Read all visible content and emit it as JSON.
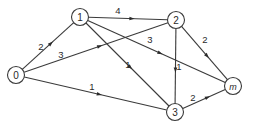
{
  "diagram": {
    "type": "directed-weighted-network",
    "nodes": [
      {
        "id": "0",
        "label": "0",
        "x": 16,
        "y": 75,
        "italic": false
      },
      {
        "id": "1",
        "label": "1",
        "x": 80,
        "y": 17,
        "italic": false
      },
      {
        "id": "2",
        "label": "2",
        "x": 176,
        "y": 20,
        "italic": false
      },
      {
        "id": "3",
        "label": "3",
        "x": 175,
        "y": 112,
        "italic": false
      },
      {
        "id": "m",
        "label": "m",
        "x": 233,
        "y": 86,
        "italic": true
      }
    ],
    "edges": [
      {
        "from": "0",
        "to": "1",
        "weight": "2",
        "label_x": 41,
        "label_y": 46
      },
      {
        "from": "0",
        "to": "2",
        "weight": "3",
        "label_x": 61,
        "label_y": 54
      },
      {
        "from": "0",
        "to": "3",
        "weight": "1",
        "label_x": 92,
        "label_y": 86
      },
      {
        "from": "1",
        "to": "2",
        "weight": "4",
        "label_x": 118,
        "label_y": 10
      },
      {
        "from": "1",
        "to": "3",
        "weight": "1",
        "label_x": 128,
        "label_y": 64
      },
      {
        "from": "1",
        "to": "m",
        "weight": "3",
        "label_x": 150,
        "label_y": 39
      },
      {
        "from": "2",
        "to": "3",
        "weight": "1",
        "label_x": 179,
        "label_y": 66
      },
      {
        "from": "2",
        "to": "m",
        "weight": "2",
        "label_x": 205,
        "label_y": 39
      },
      {
        "from": "3",
        "to": "m",
        "weight": "2",
        "label_x": 193,
        "label_y": 97
      }
    ]
  }
}
